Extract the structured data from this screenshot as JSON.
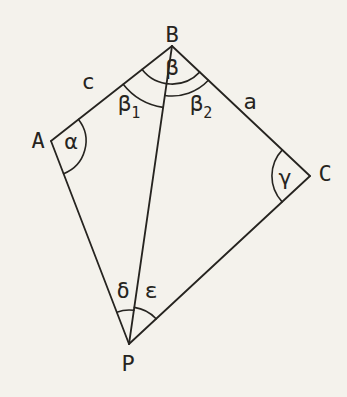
{
  "figure": {
    "description_labels": {
      "vertices": {
        "a": "A",
        "b": "B",
        "c": "C",
        "p": "P"
      },
      "sides": {
        "ab": "c",
        "bc": "a"
      },
      "angles": {
        "alpha": "α",
        "beta": "β",
        "beta1": {
          "base": "β",
          "sub": "1"
        },
        "beta2": {
          "base": "β",
          "sub": "2"
        },
        "gamma": "γ",
        "delta": "δ",
        "epsilon": "ε"
      }
    },
    "colors": {
      "paper": "#f4f2ec",
      "ink": "#262420"
    }
  }
}
